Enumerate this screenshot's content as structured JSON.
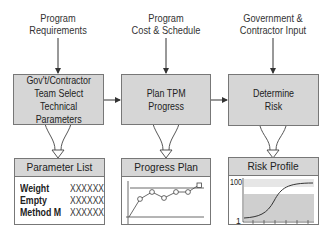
{
  "inputs": [
    {
      "line1": "Program",
      "line2": "Requirements"
    },
    {
      "line1": "Program",
      "line2": "Cost & Schedule"
    },
    {
      "line1": "Government &",
      "line2": "Contractor Input"
    }
  ],
  "processes": [
    {
      "lines": [
        "Gov't/Contractor",
        "Team Select",
        "Technical",
        "Parameters"
      ]
    },
    {
      "lines": [
        "Plan TPM",
        "Progress"
      ]
    },
    {
      "lines": [
        "Determine",
        "Risk"
      ]
    }
  ],
  "outputs": {
    "parameter_list": {
      "title": "Parameter List",
      "rows": [
        {
          "name": "Weight",
          "value": "XXXXXX"
        },
        {
          "name": "Empty",
          "value": "XXXXXX"
        },
        {
          "name": "Method M",
          "value": "XXXXXX"
        }
      ]
    },
    "progress_plan": {
      "title": "Progress Plan"
    },
    "risk_profile": {
      "title": "Risk Profile",
      "y_max_label": "100",
      "y_min_label": "1"
    }
  },
  "colors": {
    "box_fill": "#d6d6d6",
    "border": "#777777",
    "risk_band_light": "#e6e6e6",
    "risk_band_dark": "#cfcfcf",
    "line": "#333333"
  }
}
